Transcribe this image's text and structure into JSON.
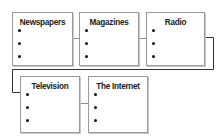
{
  "diagram": {
    "type": "flow",
    "nodes": [
      {
        "id": "newspapers",
        "label": "Newspapers",
        "bullets": 3,
        "row": 1,
        "x": 12,
        "y": 12,
        "w": 61,
        "h": 54
      },
      {
        "id": "magazines",
        "label": "Magazines",
        "bullets": 3,
        "row": 1,
        "x": 79,
        "y": 12,
        "w": 60,
        "h": 54
      },
      {
        "id": "radio",
        "label": "Radio",
        "bullets": 3,
        "row": 1,
        "x": 146,
        "y": 12,
        "w": 59,
        "h": 54
      },
      {
        "id": "television",
        "label": "Television",
        "bullets": 3,
        "row": 2,
        "x": 20,
        "y": 76,
        "w": 60,
        "h": 57
      },
      {
        "id": "the-internet",
        "label": "The Internet",
        "bullets": 3,
        "row": 2,
        "x": 88,
        "y": 76,
        "w": 60,
        "h": 57
      }
    ],
    "edges": [
      {
        "from": "newspapers",
        "to": "magazines"
      },
      {
        "from": "magazines",
        "to": "radio"
      },
      {
        "from": "radio",
        "to": "television"
      },
      {
        "from": "television",
        "to": "the-internet"
      }
    ],
    "colors": {
      "box_border": "#9a9a9a",
      "connector": "#333333",
      "text": "#1a1a1a",
      "background": "#ffffff"
    }
  }
}
